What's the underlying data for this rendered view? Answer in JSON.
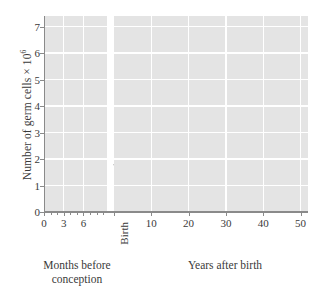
{
  "chart_data": {
    "type": "line",
    "title": "",
    "ylabel": "Number of germ cells × 10⁶",
    "ylabel_text": "Number of germ cells × 10",
    "ylabel_exponent": "6",
    "xlabel": "",
    "ylim": [
      0,
      7.4
    ],
    "yticks": [
      0,
      1,
      2,
      3,
      4,
      5,
      6,
      7
    ],
    "ytick_labels": [
      "0",
      "1",
      "2",
      "3",
      "4",
      "5",
      "6",
      "7"
    ],
    "grid": true,
    "grid_color": "#ffffff",
    "plot_bg": "#e4e4e4",
    "line_color": "#4a4a4a",
    "marker_color": "#4a4a4a",
    "legend": "none",
    "axis_break_label": "Birth",
    "panels": [
      {
        "name": "prenatal",
        "caption": "Months before\nconception",
        "caption_line1": "Months before",
        "caption_line2": "conception",
        "xlabel_unit": "months",
        "xlim": [
          0,
          9.6
        ],
        "xticks": [
          0,
          3,
          6
        ],
        "xtick_labels": [
          "0",
          "3",
          "6"
        ],
        "minor_xticks": [
          0,
          1,
          2,
          3,
          4,
          5,
          6,
          7,
          8,
          9
        ],
        "x": [
          2.0,
          3.2,
          4.0,
          5.0,
          5.9,
          6.4,
          9.2
        ],
        "y": [
          0.45,
          1.35,
          3.5,
          6.65,
          3.52,
          2.22,
          1.98
        ],
        "markers": [
          true,
          true,
          true,
          true,
          true,
          true,
          false
        ]
      },
      {
        "name": "postnatal",
        "caption": "Years after birth",
        "caption_line1": "Years after birth",
        "caption_line2": "",
        "xlabel_unit": "years",
        "xlim": [
          0,
          52
        ],
        "xticks": [
          10,
          20,
          30,
          40,
          50
        ],
        "xtick_labels": [
          "10",
          "20",
          "30",
          "40",
          "50"
        ],
        "minor_xticks": [],
        "x": [
          0.0,
          7.0,
          13.0,
          20.5,
          27.0,
          34.0,
          42.0,
          50.0
        ],
        "y": [
          1.8,
          0.55,
          0.48,
          0.22,
          0.19,
          0.2,
          0.12,
          0.08
        ],
        "markers": [
          false,
          true,
          true,
          true,
          true,
          true,
          true,
          true
        ]
      }
    ]
  }
}
